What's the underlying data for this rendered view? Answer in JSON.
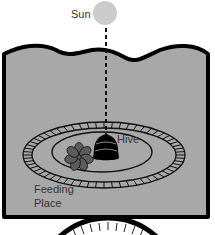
{
  "diagram": {
    "labels": {
      "sun": "Sun",
      "hive": "Hive",
      "feeding_line1": "Feeding",
      "feeding_line2": "Place"
    },
    "colors": {
      "panel_fill": "#a8a8a8",
      "sun_fill": "#cccccc",
      "outline": "#000000",
      "flower_fill": "#5c5c5c",
      "bottom_disc_fill": "#ffffff"
    },
    "icons": {
      "sun": "sun-icon",
      "hive": "beehive-icon",
      "flower": "flower-icon"
    }
  }
}
